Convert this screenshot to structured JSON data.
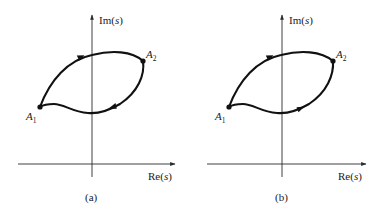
{
  "figure": {
    "panels": [
      {
        "id": "a",
        "caption": "(a)",
        "axes": {
          "x_label_prefix": "Re",
          "x_label_var": "s",
          "y_label_prefix": "Im",
          "y_label_var": "s"
        },
        "points": [
          {
            "name": "A",
            "subscript": "1"
          },
          {
            "name": "A",
            "subscript": "2"
          }
        ],
        "paths": [
          {
            "name": "upper arc",
            "from": "A1",
            "to": "A2",
            "arrow_direction": "A1->A2"
          },
          {
            "name": "lower curve",
            "from": "A2",
            "to": "A1",
            "arrow_direction": "A2->A1"
          }
        ],
        "description": "Closed contour through A1 and A2 (direction inferred; arrowheads not legible at source resolution)"
      },
      {
        "id": "b",
        "caption": "(b)",
        "axes": {
          "x_label_prefix": "Re",
          "x_label_var": "s",
          "y_label_prefix": "Im",
          "y_label_var": "s"
        },
        "points": [
          {
            "name": "A",
            "subscript": "1"
          },
          {
            "name": "A",
            "subscript": "2"
          }
        ],
        "paths": [
          {
            "name": "upper arc",
            "from": "A1",
            "to": "A2",
            "arrow_direction": "A1->A2"
          },
          {
            "name": "lower curve",
            "from": "A1",
            "to": "A2",
            "arrow_direction": "A1->A2"
          }
        ],
        "description": "Two distinct paths from A1 to A2 (direction inferred; arrowheads not legible at source resolution)"
      }
    ],
    "colors": {
      "ink": "#111111",
      "axis": "#2b2b2b",
      "background": "#ffffff"
    }
  }
}
